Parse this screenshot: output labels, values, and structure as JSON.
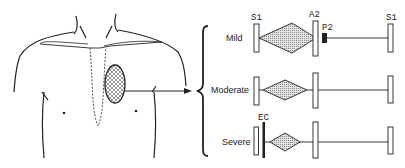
{
  "figure": {
    "torso": {
      "description": "chest outline with sternum and cross-hatched murmur area at left sternal border",
      "arrow": "right-arrow"
    },
    "rows": [
      {
        "label": "Mild",
        "markers": {
          "s1_left": "S1",
          "a2": "A2",
          "p2": "P2",
          "s1_right": "S1"
        }
      },
      {
        "label": "Moderate"
      },
      {
        "label": "Severe",
        "markers": {
          "ec": "EC"
        }
      }
    ],
    "colors": {
      "ink": "#222222",
      "hatch": "#9a9a9a",
      "background": "#ffffff"
    }
  }
}
